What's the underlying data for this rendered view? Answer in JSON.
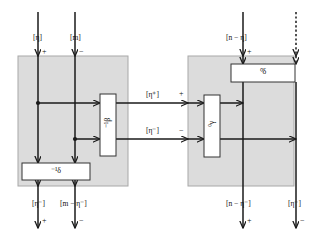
{
  "diagram": {
    "type": "string-diagram",
    "title": "",
    "colors": {
      "region_fill": "#dcdcdc",
      "region_stroke": "#a8a8a8",
      "wire": "#1a1a1a",
      "box_fill": "#ffffff",
      "box_stroke": "#333333",
      "background": "#ffffff"
    },
    "regions": [
      {
        "name": "left-region",
        "x": 18,
        "y": 56,
        "w": 110,
        "h": 130
      },
      {
        "name": "right-region",
        "x": 188,
        "y": 56,
        "w": 106,
        "h": 130
      }
    ],
    "boxes": [
      {
        "name": "box-beta-inverse",
        "label": "⁻¹β",
        "orientation": "vertical",
        "x": 100,
        "y": 94,
        "w": 16,
        "h": 62
      },
      {
        "name": "box-delta-inverse",
        "label": "⁻¹δ",
        "orientation": "horizontal",
        "x": 22,
        "y": 163,
        "w": 68,
        "h": 17
      },
      {
        "name": "box-gamma-zero",
        "label": "⁰γ",
        "orientation": "vertical",
        "x": 204,
        "y": 95,
        "w": 16,
        "h": 62
      },
      {
        "name": "box-delta-zero",
        "label": "⁰δ",
        "orientation": "horizontal",
        "x": 231,
        "y": 64,
        "w": 64,
        "h": 18
      }
    ],
    "wire_labels": [
      {
        "name": "wire-label-eta-top-left",
        "text": "[η]",
        "x": 33,
        "y": 34
      },
      {
        "name": "wire-label-m-top-left",
        "text": "[m]",
        "x": 70,
        "y": 34
      },
      {
        "name": "wire-label-n-minus-eta-top-right",
        "text": "[n − η]",
        "x": 236,
        "y": 34
      },
      {
        "name": "wire-label-eta-plus-middle",
        "text": "[η⁺]",
        "x": 148,
        "y": 91
      },
      {
        "name": "wire-label-eta-minus-middle",
        "text": "[η⁻]",
        "x": 148,
        "y": 131
      },
      {
        "name": "wire-label-eta-minus-bottom-left",
        "text": "[η⁻]",
        "x": 33,
        "y": 202
      },
      {
        "name": "wire-label-m-minus-eta-minus-bottom-left",
        "text": "[m − η⁻]",
        "x": 62,
        "y": 202
      },
      {
        "name": "wire-label-n-minus-eta-minus-bottom-right",
        "text": "[n − η⁻]",
        "x": 231,
        "y": 202
      },
      {
        "name": "wire-label-eta-minus-bottom-right",
        "text": "[η⁻]",
        "x": 285,
        "y": 202
      }
    ],
    "signs": [
      {
        "name": "sign-plus-top-left",
        "text": "+",
        "x": 42,
        "y": 49
      },
      {
        "name": "sign-minus-top-left",
        "text": "−",
        "x": 79,
        "y": 49
      },
      {
        "name": "sign-plus-top-right",
        "text": "+",
        "x": 247,
        "y": 49
      },
      {
        "name": "sign-plus-middle",
        "text": "+",
        "x": 180,
        "y": 91
      },
      {
        "name": "sign-minus-middle",
        "text": "−",
        "x": 180,
        "y": 131
      },
      {
        "name": "sign-plus-bottom-left",
        "text": "+",
        "x": 42,
        "y": 218
      },
      {
        "name": "sign-minus-bottom-left",
        "text": "−",
        "x": 79,
        "y": 218
      },
      {
        "name": "sign-plus-bottom-right",
        "text": "+",
        "x": 247,
        "y": 218
      },
      {
        "name": "sign-minus-bottom-right",
        "text": "−",
        "x": 300,
        "y": 218
      }
    ],
    "wires": [
      {
        "name": "wire-eta-left-vertical",
        "style": "solid"
      },
      {
        "name": "wire-m-left-vertical",
        "style": "solid"
      },
      {
        "name": "wire-n-minus-eta-right-vertical",
        "style": "solid"
      },
      {
        "name": "wire-eta-dashed-right-vertical",
        "style": "dashed"
      },
      {
        "name": "wire-eta-plus-horizontal",
        "style": "solid"
      },
      {
        "name": "wire-eta-minus-horizontal",
        "style": "solid"
      }
    ]
  }
}
